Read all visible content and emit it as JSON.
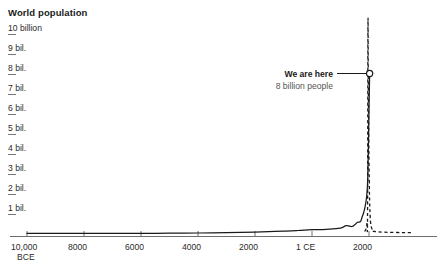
{
  "chart": {
    "title": "World population"
  },
  "annotation": {
    "title": "We are here",
    "subtitle": "8 billion people"
  },
  "colors": {
    "line": "#1a1a1a",
    "axis": "#6e6e6e",
    "tick_rule": "#777777",
    "text": "#2b2b2b",
    "title": "#1a1a1a",
    "subtext": "#555555",
    "background": "#ffffff"
  },
  "chart_data": {
    "type": "line",
    "title": "World population",
    "xlabel": "",
    "ylabel": "",
    "grid": false,
    "legend": null,
    "xlim": [
      -10000,
      3500
    ],
    "ylim": [
      0,
      10
    ],
    "y_tick_values": [
      10,
      9,
      8,
      7,
      6,
      5,
      4,
      3,
      2,
      1
    ],
    "y_tick_labels": [
      "10 billion",
      "9 bil.",
      "8 bil.",
      "7 bil.",
      "6 bil.",
      "5 bil.",
      "4 bil.",
      "3 bil.",
      "2 bil.",
      "1 bil."
    ],
    "x_tick_values": [
      -10000,
      -8000,
      -6000,
      -4000,
      -2000,
      1,
      2000
    ],
    "x_tick_labels": [
      "10,000",
      "8000",
      "6000",
      "4000",
      "2000",
      "1 CE",
      "2000"
    ],
    "x_tick_sublabels": [
      "BCE",
      "",
      "",
      "",
      "",
      "",
      ""
    ],
    "series": [
      {
        "name": "Historical population",
        "style": "solid",
        "x": [
          -10000,
          -9000,
          -8000,
          -7000,
          -6000,
          -5000,
          -4000,
          -3000,
          -2000,
          -1000,
          -500,
          1,
          500,
          1000,
          1200,
          1400,
          1500,
          1600,
          1700,
          1750,
          1800,
          1850,
          1900,
          1927,
          1950,
          1960,
          1970,
          1980,
          1990,
          2000,
          2010,
          2022
        ],
        "y": [
          0.004,
          0.005,
          0.006,
          0.007,
          0.01,
          0.015,
          0.025,
          0.04,
          0.07,
          0.12,
          0.15,
          0.19,
          0.21,
          0.27,
          0.39,
          0.35,
          0.44,
          0.56,
          0.6,
          0.79,
          0.99,
          1.26,
          1.65,
          2.0,
          2.54,
          3.03,
          3.7,
          4.45,
          5.32,
          6.14,
          6.96,
          8.0
        ]
      },
      {
        "name": "Projection / rate of growth",
        "style": "dashed",
        "x": [
          1850,
          1900,
          1930,
          1950,
          1963,
          1975,
          1990,
          2000,
          2010,
          2022,
          2040,
          2060,
          2100,
          2200,
          3000,
          3500
        ],
        "y": [
          0.1,
          0.25,
          0.55,
          1.2,
          10.4,
          7.6,
          5.1,
          3.6,
          2.6,
          1.6,
          0.9,
          0.5,
          0.25,
          0.1,
          0.05,
          0.04
        ]
      }
    ],
    "markers": [
      {
        "label": "We are here",
        "sublabel": "8 billion people",
        "x": 2022,
        "y": 8.0
      }
    ]
  }
}
